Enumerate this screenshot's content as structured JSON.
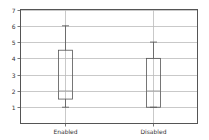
{
  "chart_data": {
    "type": "box",
    "title": "",
    "xlabel": "",
    "ylabel": "",
    "ylim": [
      0,
      7
    ],
    "yticks": [
      1,
      2,
      3,
      4,
      5,
      6,
      7
    ],
    "grid": true,
    "categories": [
      "Enabled",
      "Disabled"
    ],
    "boxes": [
      {
        "name": "Enabled",
        "whisker_low": 1,
        "q1": 1.5,
        "median": 2,
        "q3": 4.5,
        "whisker_high": 6
      },
      {
        "name": "Disabled",
        "whisker_low": 1,
        "q1": 1,
        "median": 2,
        "q3": 4,
        "whisker_high": 5
      }
    ]
  },
  "colors": {
    "frame": "#555555",
    "grid": "#bbbbbb",
    "box": "#555555",
    "median": "#999999",
    "text": "#333333"
  }
}
